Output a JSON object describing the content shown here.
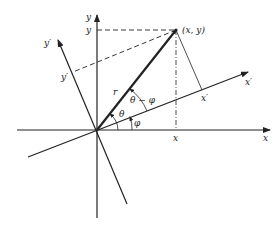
{
  "diagram": {
    "type": "coordinate-rotation",
    "origin": [
      97,
      130
    ],
    "point": {
      "label": "(x, y)",
      "pos": [
        176,
        30
      ]
    },
    "axes": {
      "x": {
        "label": "x"
      },
      "y": {
        "label": "y"
      },
      "x_prime": {
        "label": "x′"
      },
      "y_prime": {
        "label": "y′"
      }
    },
    "projections": {
      "x": "x",
      "y": "y",
      "x_prime": "x′",
      "y_prime": "y′"
    },
    "radius_label": "r",
    "angles": {
      "theta": "θ",
      "phi": "φ",
      "theta_minus_phi": "θ − φ"
    }
  }
}
